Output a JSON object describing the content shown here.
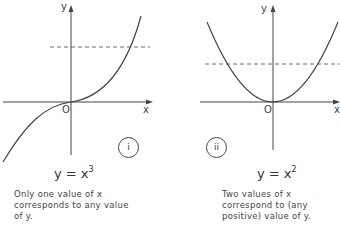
{
  "figures": [
    {
      "id": "i",
      "marker": "i",
      "equation": {
        "base": "y = x",
        "exponent": "3"
      },
      "axis_labels": {
        "x": "x",
        "y": "y",
        "origin": "O"
      },
      "caption": [
        "Only one value of  x",
        "corresponds to any value",
        "of  y."
      ]
    },
    {
      "id": "ii",
      "marker": "ii",
      "equation": {
        "base": "y = x",
        "exponent": "2"
      },
      "axis_labels": {
        "x": "x",
        "y": "y",
        "origin": "O"
      },
      "caption": [
        "Two values of  x",
        "correspond to (any",
        "positive) value  of y."
      ]
    }
  ],
  "colors": {
    "line": "#444444",
    "background": "#ffffff"
  }
}
